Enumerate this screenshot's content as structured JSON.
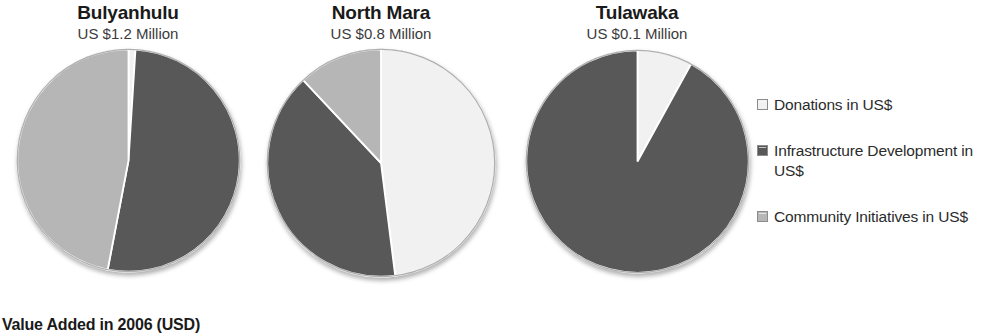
{
  "caption": "Value Added in 2006 (USD)",
  "colors": {
    "donations": "#f1f1f1",
    "infrastructure": "#585858",
    "community": "#b6b6b6",
    "outline": "#8c8c8c",
    "background": "#ffffff"
  },
  "legend": {
    "items": [
      {
        "label": "Donations in US$",
        "color_key": "donations",
        "swatch_name": "legend-swatch-donations"
      },
      {
        "label": "Infrastructure Development in US$",
        "color_key": "infrastructure",
        "swatch_name": "legend-swatch-infrastructure"
      },
      {
        "label": "Community Initiatives in US$",
        "color_key": "community",
        "swatch_name": "legend-swatch-community"
      }
    ]
  },
  "chart_data": {
    "type": "pie",
    "title": "Value Added in 2006 (USD)",
    "legend_position": "right",
    "legend": [
      "Donations in US$",
      "Infrastructure Development in US$",
      "Community Initiatives in US$"
    ],
    "series_colors": [
      "#f1f1f1",
      "#585858",
      "#b6b6b6"
    ],
    "unit": "US$ Million",
    "charts": [
      {
        "title": "Bulyanhulu",
        "subtitle": "US $1.2 Million",
        "total": 1.2,
        "categories": [
          "Donations in US$",
          "Infrastructure Development in US$",
          "Community Initiatives in US$"
        ],
        "values": [
          1,
          52,
          47
        ],
        "value_unit": "percent"
      },
      {
        "title": "North Mara",
        "subtitle": "US $0.8 Million",
        "total": 0.8,
        "categories": [
          "Donations in US$",
          "Infrastructure Development in US$",
          "Community Initiatives in US$"
        ],
        "values": [
          48,
          40,
          12
        ],
        "value_unit": "percent"
      },
      {
        "title": "Tulawaka",
        "subtitle": "US $0.1 Million",
        "total": 0.1,
        "categories": [
          "Donations in US$",
          "Infrastructure Development in US$",
          "Community Initiatives in US$"
        ],
        "values": [
          8,
          92,
          0
        ],
        "value_unit": "percent"
      }
    ]
  }
}
